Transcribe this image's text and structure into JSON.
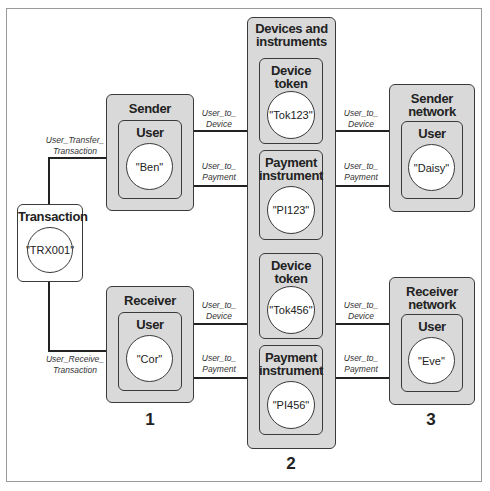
{
  "diagram": {
    "nodes": {
      "transaction": {
        "title": "Transaction",
        "value": "\"TRX001\""
      },
      "sender": {
        "group": "Sender",
        "title": "User",
        "value": "\"Ben\""
      },
      "receiver": {
        "group": "Receiver",
        "title": "User",
        "value": "\"Cor\""
      },
      "devices_group": {
        "title": "Devices and instruments"
      },
      "device_token_1": {
        "title": "Device token",
        "value": "\"Tok123\""
      },
      "payment_instrument_1": {
        "title": "Payment instrument",
        "value": "\"PI123\""
      },
      "device_token_2": {
        "title": "Device token",
        "value": "\"Tok456\""
      },
      "payment_instrument_2": {
        "title": "Payment instrument",
        "value": "\"PI456\""
      },
      "sender_network": {
        "group": "Sender network",
        "title": "User",
        "value": "\"Daisy\""
      },
      "receiver_network": {
        "group": "Receiver network",
        "title": "User",
        "value": "\"Eve\""
      }
    },
    "edges": {
      "user_transfer": "User_Transfer_ Transaction",
      "user_receive": "User_Receive_ Transaction",
      "user_to_device": "User_to_ Device",
      "user_to_payment": "User_to_ Payment"
    },
    "section_numbers": [
      "1",
      "2",
      "3"
    ]
  }
}
